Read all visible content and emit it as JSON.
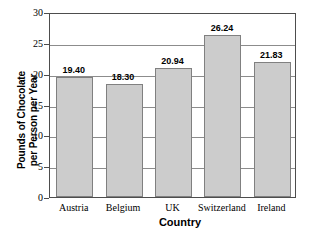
{
  "chart_data": {
    "type": "bar",
    "title": "",
    "xlabel": "Country",
    "ylabel_line1": "Pounds of Chocolate",
    "ylabel_line2": "per Person per Year",
    "categories": [
      "Austria",
      "Belgium",
      "UK",
      "Switzerland",
      "Ireland"
    ],
    "values": [
      19.4,
      18.3,
      20.94,
      26.24,
      21.83
    ],
    "value_labels": [
      "19.40",
      "18.30",
      "20.94",
      "26.24",
      "21.83"
    ],
    "ylim": [
      0,
      30
    ],
    "yticks": [
      0,
      5,
      10,
      15,
      20,
      25,
      30
    ],
    "ytick_labels": [
      "0",
      "5",
      "10",
      "15",
      "20",
      "25",
      "30"
    ],
    "grid": "horizontal",
    "legend": "none",
    "bar_fill_color": "#cccccc",
    "bar_edge_color": "#808080",
    "gridline_color": "#8c8c8c",
    "frame_color": "#4d4d4d",
    "background_color": "#ffffff"
  }
}
